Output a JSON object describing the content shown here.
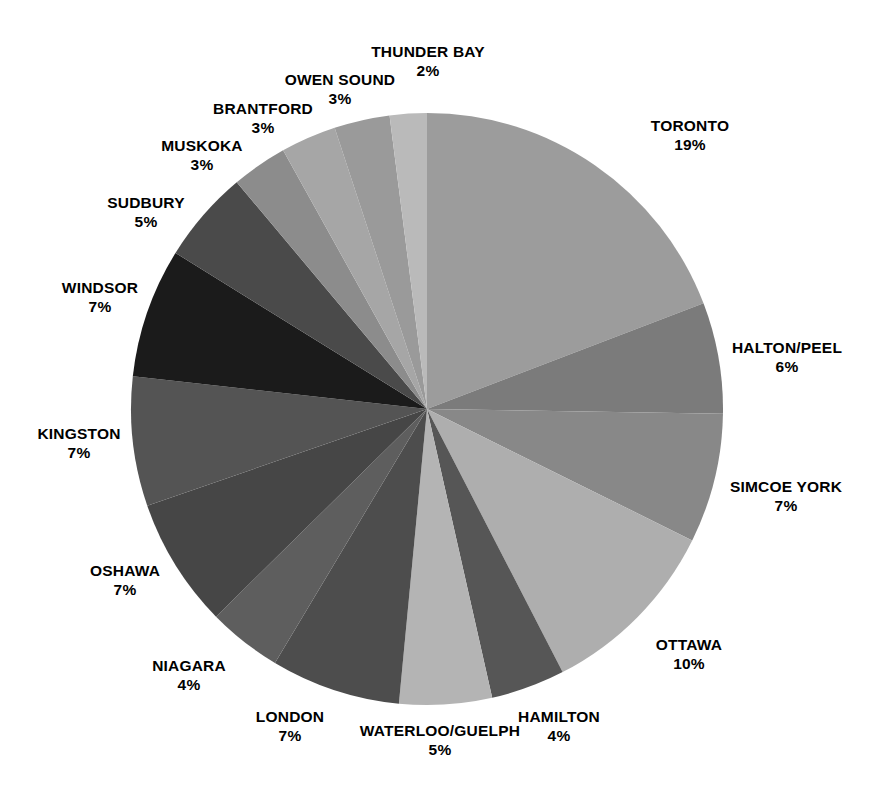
{
  "chart_data": {
    "type": "pie",
    "title": "",
    "subtitle": "",
    "xlabel": "",
    "ylabel": "",
    "legend_position": "none",
    "grid": false,
    "label_format": "NAME\nP%",
    "units": "percent",
    "start_angle_deg": 0,
    "direction": "clockwise",
    "total_percent": 105,
    "categories": [
      "TORONTO",
      "HALTON/PEEL",
      "SIMCOE YORK",
      "OTTAWA",
      "HAMILTON",
      "WATERLOO/GUELPH",
      "LONDON",
      "NIAGARA",
      "OSHAWA",
      "KINGSTON",
      "WINDSOR",
      "SUDBURY",
      "MUSKOKA",
      "BRANTFORD",
      "OWEN SOUND",
      "THUNDER BAY"
    ],
    "values": [
      19,
      6,
      7,
      10,
      4,
      5,
      7,
      4,
      7,
      7,
      7,
      5,
      3,
      3,
      3,
      2
    ],
    "slices": [
      {
        "name": "TORONTO",
        "value": 19,
        "value_label": "19%",
        "color": "#9c9c9c",
        "label_x": 690,
        "label_y": 135,
        "label_align": "center"
      },
      {
        "name": "HALTON/PEEL",
        "value": 6,
        "value_label": "6%",
        "color": "#7b7b7b",
        "label_x": 787,
        "label_y": 357,
        "label_align": "center"
      },
      {
        "name": "SIMCOE YORK",
        "value": 7,
        "value_label": "7%",
        "color": "#888888",
        "label_x": 786,
        "label_y": 496,
        "label_align": "center"
      },
      {
        "name": "OTTAWA",
        "value": 10,
        "value_label": "10%",
        "color": "#aeaeae",
        "label_x": 689,
        "label_y": 654,
        "label_align": "center"
      },
      {
        "name": "HAMILTON",
        "value": 4,
        "value_label": "4%",
        "color": "#565656",
        "label_x": 559,
        "label_y": 726,
        "label_align": "center"
      },
      {
        "name": "WATERLOO/GUELPH",
        "value": 5,
        "value_label": "5%",
        "color": "#b4b4b4",
        "label_x": 440,
        "label_y": 740,
        "label_align": "center"
      },
      {
        "name": "LONDON",
        "value": 7,
        "value_label": "7%",
        "color": "#4d4d4d",
        "label_x": 290,
        "label_y": 726,
        "label_align": "center"
      },
      {
        "name": "NIAGARA",
        "value": 4,
        "value_label": "4%",
        "color": "#5e5e5e",
        "label_x": 189,
        "label_y": 675,
        "label_align": "center"
      },
      {
        "name": "OSHAWA",
        "value": 7,
        "value_label": "7%",
        "color": "#464646",
        "label_x": 125,
        "label_y": 580,
        "label_align": "center"
      },
      {
        "name": "KINGSTON",
        "value": 7,
        "value_label": "7%",
        "color": "#545454",
        "label_x": 79,
        "label_y": 443,
        "label_align": "center"
      },
      {
        "name": "WINDSOR",
        "value": 7,
        "value_label": "7%",
        "color": "#1b1b1b",
        "label_x": 100,
        "label_y": 297,
        "label_align": "center"
      },
      {
        "name": "SUDBURY",
        "value": 5,
        "value_label": "5%",
        "color": "#4a4a4a",
        "label_x": 146,
        "label_y": 212,
        "label_align": "center"
      },
      {
        "name": "MUSKOKA",
        "value": 3,
        "value_label": "3%",
        "color": "#8c8c8c",
        "label_x": 202,
        "label_y": 155,
        "label_align": "center"
      },
      {
        "name": "BRANTFORD",
        "value": 3,
        "value_label": "3%",
        "color": "#a6a6a6",
        "label_x": 263,
        "label_y": 118,
        "label_align": "center"
      },
      {
        "name": "OWEN SOUND",
        "value": 3,
        "value_label": "3%",
        "color": "#9a9a9a",
        "label_x": 340,
        "label_y": 89,
        "label_align": "center"
      },
      {
        "name": "THUNDER BAY",
        "value": 2,
        "value_label": "2%",
        "color": "#bababa",
        "label_x": 428,
        "label_y": 61,
        "label_align": "center"
      }
    ],
    "geometry": {
      "center_x": 427,
      "center_y": 409,
      "radius": 296
    },
    "background_color": "#ffffff",
    "label_color": "#000000"
  }
}
